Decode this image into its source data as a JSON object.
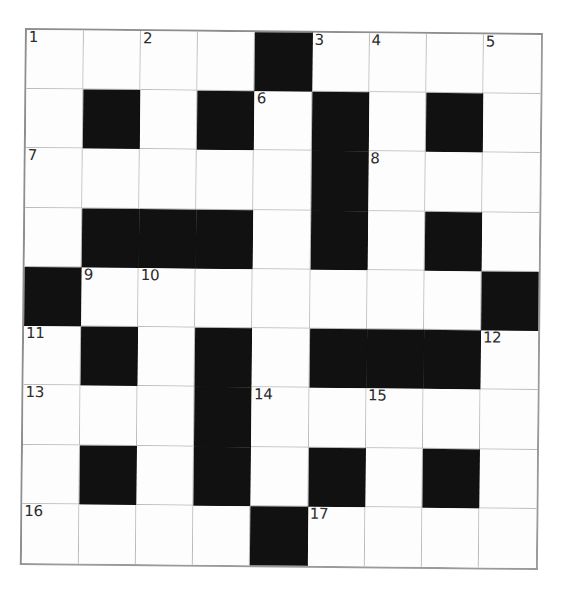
{
  "page": {
    "background_color": "#ffffff"
  },
  "grid": {
    "rows": 9,
    "columns": 9,
    "block_color": "#111111",
    "cell_color": "#fdfdfd",
    "line_color": "#b9b9b9",
    "border_color": "#8e8e8e",
    "number_color": "#2b2b2b",
    "cells": [
      [
        {
          "black": false,
          "number": "1",
          "letter": ""
        },
        {
          "black": false,
          "number": "",
          "letter": ""
        },
        {
          "black": false,
          "number": "2",
          "letter": ""
        },
        {
          "black": false,
          "number": "",
          "letter": ""
        },
        {
          "black": true,
          "number": "",
          "letter": ""
        },
        {
          "black": false,
          "number": "3",
          "letter": ""
        },
        {
          "black": false,
          "number": "4",
          "letter": ""
        },
        {
          "black": false,
          "number": "",
          "letter": ""
        },
        {
          "black": false,
          "number": "5",
          "letter": ""
        }
      ],
      [
        {
          "black": false,
          "number": "",
          "letter": ""
        },
        {
          "black": true,
          "number": "",
          "letter": ""
        },
        {
          "black": false,
          "number": "",
          "letter": ""
        },
        {
          "black": true,
          "number": "",
          "letter": ""
        },
        {
          "black": false,
          "number": "6",
          "letter": ""
        },
        {
          "black": true,
          "number": "",
          "letter": ""
        },
        {
          "black": false,
          "number": "",
          "letter": ""
        },
        {
          "black": true,
          "number": "",
          "letter": ""
        },
        {
          "black": false,
          "number": "",
          "letter": ""
        }
      ],
      [
        {
          "black": false,
          "number": "7",
          "letter": ""
        },
        {
          "black": false,
          "number": "",
          "letter": ""
        },
        {
          "black": false,
          "number": "",
          "letter": ""
        },
        {
          "black": false,
          "number": "",
          "letter": ""
        },
        {
          "black": false,
          "number": "",
          "letter": ""
        },
        {
          "black": true,
          "number": "",
          "letter": ""
        },
        {
          "black": false,
          "number": "8",
          "letter": ""
        },
        {
          "black": false,
          "number": "",
          "letter": ""
        },
        {
          "black": false,
          "number": "",
          "letter": ""
        }
      ],
      [
        {
          "black": false,
          "number": "",
          "letter": ""
        },
        {
          "black": true,
          "number": "",
          "letter": ""
        },
        {
          "black": true,
          "number": "",
          "letter": ""
        },
        {
          "black": true,
          "number": "",
          "letter": ""
        },
        {
          "black": false,
          "number": "",
          "letter": ""
        },
        {
          "black": true,
          "number": "",
          "letter": ""
        },
        {
          "black": false,
          "number": "",
          "letter": ""
        },
        {
          "black": true,
          "number": "",
          "letter": ""
        },
        {
          "black": false,
          "number": "",
          "letter": ""
        }
      ],
      [
        {
          "black": true,
          "number": "",
          "letter": ""
        },
        {
          "black": false,
          "number": "9",
          "letter": ""
        },
        {
          "black": false,
          "number": "10",
          "letter": ""
        },
        {
          "black": false,
          "number": "",
          "letter": ""
        },
        {
          "black": false,
          "number": "",
          "letter": ""
        },
        {
          "black": false,
          "number": "",
          "letter": ""
        },
        {
          "black": false,
          "number": "",
          "letter": ""
        },
        {
          "black": false,
          "number": "",
          "letter": ""
        },
        {
          "black": true,
          "number": "",
          "letter": ""
        }
      ],
      [
        {
          "black": false,
          "number": "11",
          "letter": ""
        },
        {
          "black": true,
          "number": "",
          "letter": ""
        },
        {
          "black": false,
          "number": "",
          "letter": ""
        },
        {
          "black": true,
          "number": "",
          "letter": ""
        },
        {
          "black": false,
          "number": "",
          "letter": ""
        },
        {
          "black": true,
          "number": "",
          "letter": ""
        },
        {
          "black": true,
          "number": "",
          "letter": ""
        },
        {
          "black": true,
          "number": "",
          "letter": ""
        },
        {
          "black": false,
          "number": "12",
          "letter": ""
        }
      ],
      [
        {
          "black": false,
          "number": "13",
          "letter": ""
        },
        {
          "black": false,
          "number": "",
          "letter": ""
        },
        {
          "black": false,
          "number": "",
          "letter": ""
        },
        {
          "black": true,
          "number": "",
          "letter": ""
        },
        {
          "black": false,
          "number": "14",
          "letter": ""
        },
        {
          "black": false,
          "number": "",
          "letter": ""
        },
        {
          "black": false,
          "number": "15",
          "letter": ""
        },
        {
          "black": false,
          "number": "",
          "letter": ""
        },
        {
          "black": false,
          "number": "",
          "letter": ""
        }
      ],
      [
        {
          "black": false,
          "number": "",
          "letter": ""
        },
        {
          "black": true,
          "number": "",
          "letter": ""
        },
        {
          "black": false,
          "number": "",
          "letter": ""
        },
        {
          "black": true,
          "number": "",
          "letter": ""
        },
        {
          "black": false,
          "number": "",
          "letter": ""
        },
        {
          "black": true,
          "number": "",
          "letter": ""
        },
        {
          "black": false,
          "number": "",
          "letter": ""
        },
        {
          "black": true,
          "number": "",
          "letter": ""
        },
        {
          "black": false,
          "number": "",
          "letter": ""
        }
      ],
      [
        {
          "black": false,
          "number": "16",
          "letter": ""
        },
        {
          "black": false,
          "number": "",
          "letter": ""
        },
        {
          "black": false,
          "number": "",
          "letter": ""
        },
        {
          "black": false,
          "number": "",
          "letter": ""
        },
        {
          "black": true,
          "number": "",
          "letter": ""
        },
        {
          "black": false,
          "number": "17",
          "letter": ""
        },
        {
          "black": false,
          "number": "",
          "letter": ""
        },
        {
          "black": false,
          "number": "",
          "letter": ""
        },
        {
          "black": false,
          "number": "",
          "letter": ""
        }
      ]
    ]
  }
}
